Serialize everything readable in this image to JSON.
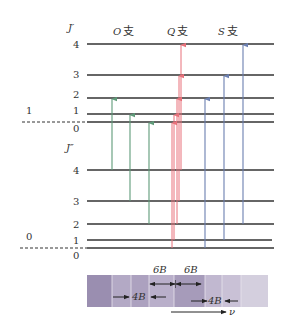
{
  "diagram": {
    "upper_state": {
      "j_label": "J′",
      "vib_label": "1",
      "levels": [
        {
          "j": "4",
          "y": 44
        },
        {
          "j": "3",
          "y": 75
        },
        {
          "j": "2",
          "y": 98
        },
        {
          "j": "1",
          "y": 114
        },
        {
          "j": "0",
          "y": 122
        }
      ]
    },
    "lower_state": {
      "j_label": "J″",
      "vib_label": "0",
      "levels": [
        {
          "j": "4",
          "y": 170
        },
        {
          "j": "3",
          "y": 201
        },
        {
          "j": "2",
          "y": 224
        },
        {
          "j": "1",
          "y": 240
        },
        {
          "j": "0",
          "y": 248
        }
      ]
    },
    "branches": [
      {
        "name": "O",
        "suffix": "支",
        "color": "#5e9a78"
      },
      {
        "name": "Q",
        "suffix": "支",
        "color": "#e8707a"
      },
      {
        "name": "S",
        "suffix": "支",
        "color": "#6b7fb0"
      }
    ],
    "spectrum": {
      "label_6B_left": "6B",
      "label_6B_right": "6B",
      "label_4B_left": "4B",
      "label_4B_right": "4B",
      "axis_label": "ν",
      "band_color": "#a89bbb"
    }
  }
}
